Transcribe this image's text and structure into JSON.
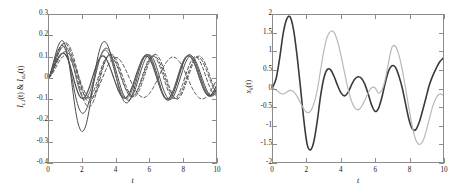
{
  "figure": {
    "background": "#ffffff",
    "axis_color": "#8c8c8c",
    "panels": [
      {
        "id": "left",
        "ylabel_main1": "I",
        "ylabel_sub1": "c,i",
        "ylabel_mid": "(t) & ",
        "ylabel_main2": "I",
        "ylabel_sub2": "a,i",
        "ylabel_end": "(t)",
        "xlabel": "t"
      },
      {
        "id": "right",
        "ylabel_main1": "x",
        "ylabel_sub1": "k",
        "ylabel_end": "(t)",
        "xlabel": "t"
      }
    ]
  },
  "chart_data": [
    {
      "type": "line",
      "id": "left-panel",
      "title": "",
      "xlabel": "t",
      "ylabel": "I_{c,i}(t) & I_{a,i}(t)",
      "xlim": [
        0,
        10
      ],
      "ylim": [
        -0.4,
        0.3
      ],
      "xticks": [
        0,
        2,
        4,
        6,
        8,
        10
      ],
      "yticks": [
        0.3,
        0.2,
        0.1,
        0,
        -0.1,
        -0.2,
        -0.3,
        -0.4
      ],
      "xticklabels": [
        "0",
        "2",
        "4",
        "6",
        "8",
        "10"
      ],
      "yticklabels": [
        "0.3",
        "0.2",
        "0.1",
        "0",
        "-0.1",
        "-0.2",
        "-0.3",
        "-0.4"
      ],
      "grid": false,
      "legend": null,
      "x": [
        0,
        0.2,
        0.4,
        0.6,
        0.8,
        1.0,
        1.2,
        1.4,
        1.6,
        1.8,
        2.0,
        2.2,
        2.4,
        2.6,
        2.8,
        3.0,
        3.2,
        3.4,
        3.6,
        3.8,
        4.0,
        4.2,
        4.4,
        4.6,
        4.8,
        5.0,
        5.2,
        5.4,
        5.6,
        5.8,
        6.0,
        6.2,
        6.4,
        6.6,
        6.8,
        7.0,
        7.2,
        7.4,
        7.6,
        7.8,
        8.0,
        8.2,
        8.4,
        8.6,
        8.8,
        9.0,
        9.2,
        9.4,
        9.6,
        9.8,
        10.0
      ],
      "series": [
        {
          "name": "I_c,1",
          "style": "solid",
          "color": "#4d4d4d",
          "width": 1.0,
          "values": [
            0,
            0.055,
            0.115,
            0.162,
            0.178,
            0.15,
            0.072,
            -0.045,
            -0.16,
            -0.232,
            -0.255,
            -0.228,
            -0.155,
            -0.055,
            0.048,
            0.125,
            0.168,
            0.17,
            0.138,
            0.08,
            0.012,
            -0.052,
            -0.098,
            -0.118,
            -0.11,
            -0.075,
            -0.022,
            0.035,
            0.082,
            0.108,
            0.108,
            0.082,
            0.035,
            -0.02,
            -0.07,
            -0.1,
            -0.105,
            -0.082,
            -0.04,
            0.012,
            0.062,
            0.098,
            0.112,
            0.1,
            0.068,
            0.022,
            -0.025,
            -0.062,
            -0.082,
            -0.08,
            -0.058
          ]
        },
        {
          "name": "I_c,2",
          "style": "solid",
          "color": "#4d4d4d",
          "width": 1.0,
          "values": [
            0,
            0.048,
            0.1,
            0.14,
            0.155,
            0.132,
            0.072,
            -0.01,
            -0.09,
            -0.145,
            -0.168,
            -0.155,
            -0.112,
            -0.05,
            0.018,
            0.08,
            0.125,
            0.142,
            0.13,
            0.092,
            0.038,
            -0.018,
            -0.068,
            -0.098,
            -0.105,
            -0.085,
            -0.045,
            0.008,
            0.058,
            0.095,
            0.11,
            0.098,
            0.062,
            0.01,
            -0.042,
            -0.082,
            -0.102,
            -0.095,
            -0.062,
            -0.015,
            0.035,
            0.078,
            0.102,
            0.102,
            0.078,
            0.038,
            -0.008,
            -0.05,
            -0.078,
            -0.085,
            -0.072
          ]
        },
        {
          "name": "I_c,3",
          "style": "solid",
          "color": "#4d4d4d",
          "width": 1.2,
          "values": [
            0,
            0.032,
            0.07,
            0.102,
            0.118,
            0.11,
            0.075,
            0.02,
            -0.038,
            -0.082,
            -0.098,
            -0.085,
            -0.048,
            0.002,
            0.052,
            0.09,
            0.105,
            0.095,
            0.062,
            0.018,
            -0.028,
            -0.068,
            -0.092,
            -0.095,
            -0.075,
            -0.038,
            0.01,
            0.055,
            0.09,
            0.105,
            0.095,
            0.062,
            0.015,
            -0.035,
            -0.075,
            -0.098,
            -0.095,
            -0.068,
            -0.025,
            0.025,
            0.07,
            0.098,
            0.105,
            0.088,
            0.052,
            0.005,
            -0.04,
            -0.072,
            -0.085,
            -0.072,
            -0.04
          ]
        },
        {
          "name": "I_c,4",
          "style": "solid",
          "color": "#666666",
          "width": 1.0,
          "values": [
            0,
            0.038,
            0.082,
            0.122,
            0.148,
            0.15,
            0.125,
            0.075,
            0.01,
            -0.052,
            -0.092,
            -0.1,
            -0.075,
            -0.028,
            0.03,
            0.085,
            0.122,
            0.132,
            0.112,
            0.068,
            0.012,
            -0.042,
            -0.082,
            -0.098,
            -0.088,
            -0.052,
            -0.002,
            0.05,
            0.092,
            0.112,
            0.105,
            0.072,
            0.022,
            -0.032,
            -0.078,
            -0.102,
            -0.098,
            -0.07,
            -0.022,
            0.03,
            0.075,
            0.102,
            0.105,
            0.085,
            0.048,
            0.002,
            -0.042,
            -0.075,
            -0.088,
            -0.082,
            -0.055
          ]
        },
        {
          "name": "I_a,1",
          "style": "dashed",
          "color": "#555555",
          "width": 1.0,
          "values": [
            0,
            0.035,
            0.082,
            0.128,
            0.158,
            0.168,
            0.155,
            0.118,
            0.062,
            0.0,
            -0.058,
            -0.098,
            -0.115,
            -0.1,
            -0.06,
            -0.005,
            0.05,
            0.092,
            0.112,
            0.108,
            0.08,
            0.038,
            -0.01,
            -0.052,
            -0.08,
            -0.088,
            -0.072,
            -0.035,
            0.012,
            0.058,
            0.092,
            0.105,
            0.095,
            0.062,
            0.018,
            -0.032,
            -0.072,
            -0.095,
            -0.095,
            -0.07,
            -0.03,
            0.018,
            0.062,
            0.092,
            0.102,
            0.085,
            0.05,
            0.005,
            -0.038,
            -0.07,
            -0.082
          ]
        },
        {
          "name": "I_a,2",
          "style": "dashed",
          "color": "#555555",
          "width": 1.0,
          "values": [
            0,
            0.02,
            0.048,
            0.078,
            0.1,
            0.108,
            0.098,
            0.068,
            0.02,
            -0.035,
            -0.088,
            -0.125,
            -0.138,
            -0.122,
            -0.08,
            -0.022,
            0.038,
            0.085,
            0.11,
            0.112,
            0.092,
            0.055,
            0.01,
            -0.035,
            -0.07,
            -0.088,
            -0.085,
            -0.06,
            -0.018,
            0.03,
            0.075,
            0.105,
            0.112,
            0.095,
            0.058,
            0.01,
            -0.04,
            -0.08,
            -0.1,
            -0.095,
            -0.068,
            -0.025,
            0.022,
            0.065,
            0.095,
            0.105,
            0.092,
            0.06,
            0.018,
            -0.028,
            -0.068
          ]
        },
        {
          "name": "I_a,3",
          "style": "dashed",
          "color": "#555555",
          "width": 1.0,
          "values": [
            0,
            0.045,
            0.092,
            0.135,
            0.162,
            0.165,
            0.142,
            0.098,
            0.042,
            -0.015,
            -0.062,
            -0.09,
            -0.095,
            -0.075,
            -0.035,
            0.015,
            0.062,
            0.095,
            0.108,
            0.098,
            0.07,
            0.03,
            -0.015,
            -0.055,
            -0.082,
            -0.09,
            -0.075,
            -0.042,
            0.002,
            0.048,
            0.085,
            0.105,
            0.102,
            0.078,
            0.038,
            -0.01,
            -0.055,
            -0.085,
            -0.098,
            -0.085,
            -0.052,
            -0.008,
            0.038,
            0.075,
            0.098,
            0.098,
            0.078,
            0.042,
            0.0,
            -0.04,
            -0.07
          ]
        },
        {
          "name": "I_a,4",
          "style": "dashed",
          "color": "#555555",
          "width": 1.0,
          "values": [
            0,
            0.028,
            0.062,
            0.095,
            0.118,
            0.125,
            0.115,
            0.088,
            0.048,
            0.002,
            -0.042,
            -0.075,
            -0.092,
            -0.09,
            -0.07,
            -0.038,
            0.0,
            0.038,
            0.07,
            0.09,
            0.098,
            0.09,
            0.068,
            0.038,
            0.002,
            -0.032,
            -0.062,
            -0.082,
            -0.092,
            -0.09,
            -0.075,
            -0.052,
            -0.022,
            0.012,
            0.045,
            0.072,
            0.092,
            0.1,
            0.095,
            0.078,
            0.052,
            0.018,
            -0.018,
            -0.052,
            -0.078,
            -0.095,
            -0.1,
            -0.092,
            -0.072,
            -0.045,
            -0.015
          ]
        }
      ]
    },
    {
      "type": "line",
      "id": "right-panel",
      "title": "",
      "xlabel": "t",
      "ylabel": "x_k(t)",
      "xlim": [
        0,
        10
      ],
      "ylim": [
        -2,
        2
      ],
      "xticks": [
        0,
        2,
        4,
        6,
        8,
        10
      ],
      "yticks": [
        2,
        1.5,
        1,
        0.5,
        0,
        -0.5,
        -1,
        -1.5,
        -2
      ],
      "xticklabels": [
        "0",
        "2",
        "4",
        "6",
        "8",
        "10"
      ],
      "yticklabels": [
        "2",
        "1.5",
        "1",
        "0.5",
        "0",
        "-0.5",
        "-1",
        "-1.5",
        "-2"
      ],
      "grid": false,
      "legend": null,
      "x": [
        0,
        0.2,
        0.4,
        0.6,
        0.8,
        1.0,
        1.2,
        1.4,
        1.6,
        1.8,
        2.0,
        2.2,
        2.4,
        2.6,
        2.8,
        3.0,
        3.2,
        3.4,
        3.6,
        3.8,
        4.0,
        4.2,
        4.4,
        4.6,
        4.8,
        5.0,
        5.2,
        5.4,
        5.6,
        5.8,
        6.0,
        6.2,
        6.4,
        6.6,
        6.8,
        7.0,
        7.2,
        7.4,
        7.6,
        7.8,
        8.0,
        8.2,
        8.4,
        8.6,
        8.8,
        9.0,
        9.2,
        9.4,
        9.6,
        9.8,
        10.0
      ],
      "series": [
        {
          "name": "x_1",
          "style": "solid",
          "color": "#3a3a3a",
          "width": 1.6,
          "values": [
            0.05,
            0.3,
            0.85,
            1.5,
            1.88,
            1.95,
            1.62,
            0.95,
            0.1,
            -0.8,
            -1.5,
            -1.67,
            -1.45,
            -0.9,
            -0.2,
            0.3,
            0.52,
            0.5,
            0.32,
            0.08,
            -0.12,
            -0.2,
            -0.12,
            0.08,
            0.25,
            0.32,
            0.28,
            0.12,
            -0.15,
            -0.45,
            -0.62,
            -0.55,
            -0.25,
            0.15,
            0.48,
            0.62,
            0.58,
            0.35,
            0.02,
            -0.42,
            -0.85,
            -1.1,
            -1.12,
            -0.92,
            -0.6,
            -0.25,
            0.1,
            0.35,
            0.55,
            0.72,
            0.82
          ]
        },
        {
          "name": "x_2",
          "style": "solid",
          "color": "#b8b8b8",
          "width": 1.2,
          "values": [
            0.02,
            -0.05,
            -0.12,
            -0.15,
            -0.1,
            -0.05,
            -0.08,
            -0.2,
            -0.38,
            -0.55,
            -0.65,
            -0.62,
            -0.42,
            -0.05,
            0.5,
            1.05,
            1.42,
            1.56,
            1.52,
            1.28,
            0.9,
            0.45,
            0.02,
            -0.32,
            -0.52,
            -0.58,
            -0.5,
            -0.32,
            -0.12,
            0.02,
            0.02,
            -0.12,
            -0.05,
            0.25,
            0.72,
            1.12,
            1.15,
            0.92,
            0.52,
            0.0,
            -0.55,
            -1.05,
            -1.4,
            -1.52,
            -1.45,
            -1.18,
            -0.82,
            -0.48,
            -0.25,
            -0.15,
            -0.18
          ]
        }
      ]
    }
  ]
}
